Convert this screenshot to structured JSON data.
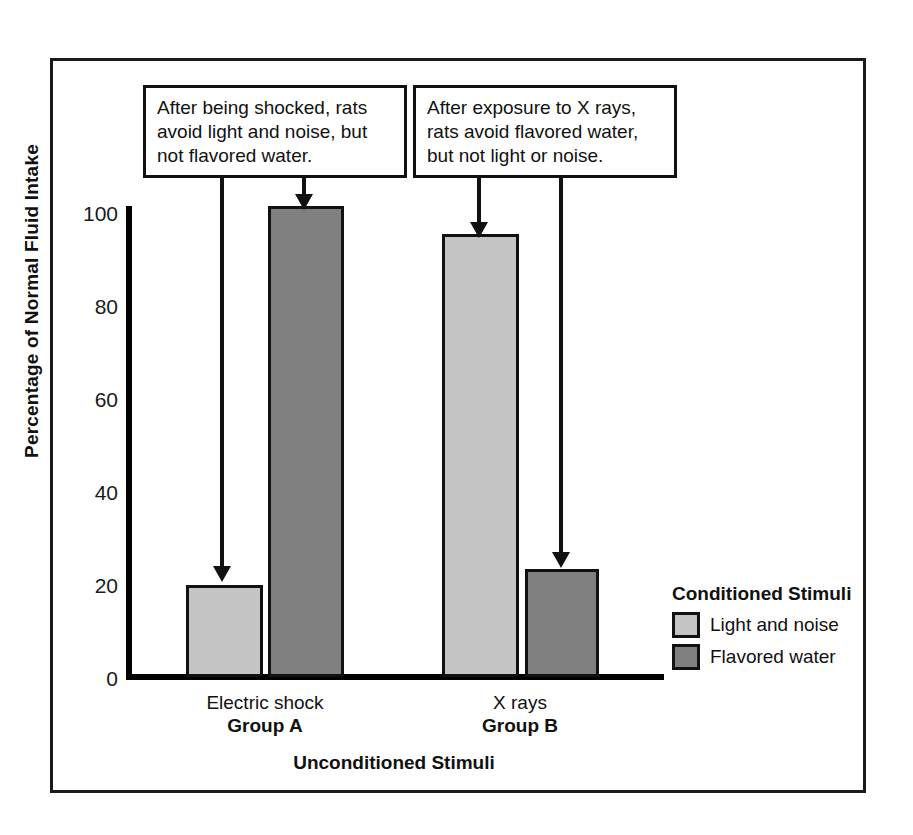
{
  "chart_data": {
    "type": "bar",
    "title": "",
    "xlabel": "Unconditioned Stimuli",
    "ylabel": "Percentage of Normal Fluid Intake",
    "ylim": [
      0,
      100
    ],
    "yticks": [
      0,
      20,
      40,
      60,
      80,
      100
    ],
    "grid": false,
    "legend_position": "right",
    "legend_title": "Conditioned Stimuli",
    "categories": [
      "Group A",
      "Group B"
    ],
    "category_sublabels": [
      "Electric shock",
      "X rays"
    ],
    "series": [
      {
        "name": "Light and noise",
        "color": "#c4c4c4",
        "values": [
          19.5,
          94
        ]
      },
      {
        "name": "Flavored water",
        "color": "#808080",
        "values": [
          100,
          23
        ]
      }
    ],
    "annotations": [
      {
        "id": "note-group-a",
        "text": "After being shocked, rats avoid light and noise, but not flavored water.",
        "points_to": [
          "Group A / Light and noise",
          "Group A / Flavored water"
        ]
      },
      {
        "id": "note-group-b",
        "text": "After exposure to X rays, rats avoid flavored water, but not light or noise.",
        "points_to": [
          "Group B / Light and noise",
          "Group B / Flavored water"
        ]
      }
    ]
  },
  "axis": {
    "y_title": "Percentage of Normal Fluid Intake",
    "x_title": "Unconditioned Stimuli",
    "y_tick_labels": [
      "100",
      "80",
      "60",
      "40",
      "20",
      "0"
    ]
  },
  "groups": [
    {
      "unconditioned": "Electric shock",
      "name": "Group A"
    },
    {
      "unconditioned": "X rays",
      "name": "Group B"
    }
  ],
  "legend": {
    "title": "Conditioned Stimuli",
    "items": [
      {
        "label": "Light and noise",
        "color": "#c4c4c4"
      },
      {
        "label": "Flavored water",
        "color": "#808080"
      }
    ]
  },
  "callouts": [
    {
      "line1": "After being shocked, rats",
      "line2": "avoid light and noise, but",
      "line3": "not flavored water."
    },
    {
      "line1": "After exposure to X rays,",
      "line2": "rats avoid flavored water,",
      "line3": "but not light or noise."
    }
  ]
}
